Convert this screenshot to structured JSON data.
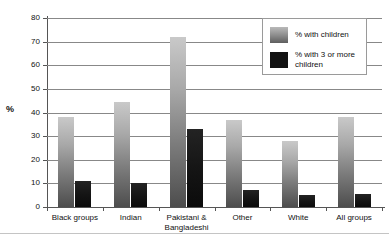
{
  "chart_data": {
    "type": "bar",
    "title": "",
    "xlabel": "",
    "ylabel": "%",
    "ylim": [
      0,
      80
    ],
    "ytick_step": 10,
    "yticks": [
      0,
      10,
      20,
      30,
      40,
      50,
      60,
      70,
      80
    ],
    "grid": true,
    "legend_position": "top-right",
    "categories": [
      "Black groups",
      "Indian",
      "Pakistani & Bangladeshi",
      "Other",
      "White",
      "All groups"
    ],
    "series": [
      {
        "name": "% with children",
        "color": "#8e8e8e",
        "values": [
          38,
          44.5,
          72,
          37,
          28,
          38
        ]
      },
      {
        "name": "% with 3 or more children",
        "color": "#121212",
        "values": [
          11,
          10,
          33,
          7,
          5,
          5.5
        ]
      }
    ]
  },
  "legend": {
    "items": [
      {
        "label": "% with children",
        "swatch": "gray-gradient-swatch"
      },
      {
        "label": "% with 3 or more children",
        "swatch": "black-swatch"
      }
    ]
  },
  "axis": {
    "y_title": "%",
    "tick_labels": [
      "80",
      "70",
      "60",
      "50",
      "40",
      "30",
      "20",
      "10",
      "0"
    ]
  }
}
